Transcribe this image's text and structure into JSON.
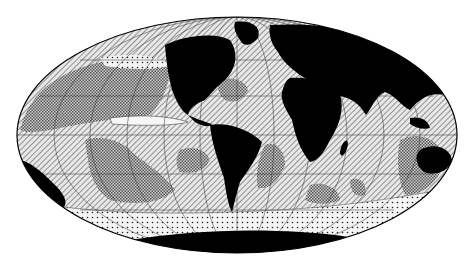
{
  "figure": {
    "type": "world-map",
    "projection": "Mollweide (elliptical equal-area)",
    "background": "#ffffff"
  },
  "legend_patterns": [
    {
      "id": "land",
      "description": "Continents (solid black)",
      "color": "#000000"
    },
    {
      "id": "diagonal-hatch",
      "description": "Diagonal-hatched sediment zone (e.g. calcareous ooze)"
    },
    {
      "id": "checker-grey",
      "description": "Grey checkered sediment zone (e.g. red clay)"
    },
    {
      "id": "dotted",
      "description": "Dotted sediment zone (e.g. siliceous / diatom ooze, high latitudes)"
    },
    {
      "id": "white",
      "description": "Unpatterned white zones (e.g. terrigenous / glacial sediments, equatorial belt)"
    }
  ],
  "regions": {
    "continents": [
      "North America",
      "South America",
      "Europe",
      "Asia",
      "Africa",
      "Australia",
      "Antarctica",
      "Greenland"
    ],
    "oceans": [
      "Pacific Ocean (west)",
      "Pacific Ocean (east)",
      "Atlantic Ocean",
      "Indian Ocean",
      "Southern Ocean"
    ]
  },
  "graticule": {
    "meridians": true,
    "parallels": true,
    "color": "#333333"
  },
  "colors": {
    "land": "#000000",
    "ocean_base": "#d8d8d8",
    "hatch_line": "#3a3a3a",
    "outline": "#000000"
  }
}
